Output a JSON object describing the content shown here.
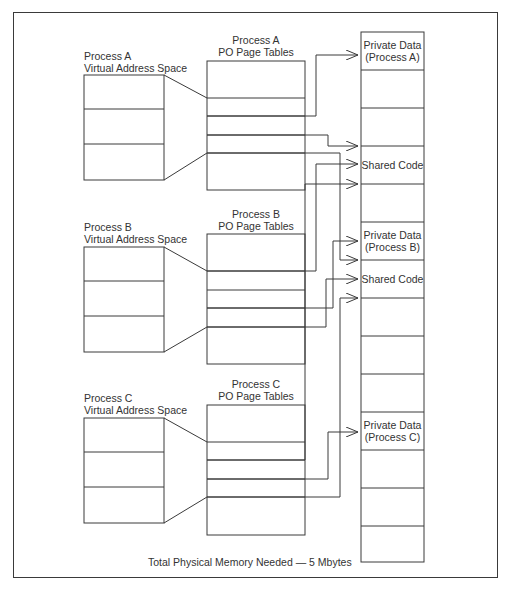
{
  "diagram": {
    "caption": "Total Physical Memory Needed — 5 Mbytes",
    "colors": {
      "line": "#3a3a3a",
      "text": "#333333",
      "background": "#ffffff"
    },
    "processes": [
      {
        "id": "A",
        "va_label_line1": "Process A",
        "va_label_line2": "Virtual Address Space",
        "pt_label_line1": "Process A",
        "pt_label_line2": "PO Page Tables"
      },
      {
        "id": "B",
        "va_label_line1": "Process B",
        "va_label_line2": "Virtual Address Space",
        "pt_label_line1": "Process B",
        "pt_label_line2": "PO Page Tables"
      },
      {
        "id": "C",
        "va_label_line1": "Process C",
        "va_label_line2": "Virtual Address Space",
        "pt_label_line1": "Process C",
        "pt_label_line2": "PO Page Tables"
      }
    ],
    "physical_memory": {
      "frames": [
        {
          "index": 0,
          "line1": "Private Data",
          "line2": "(Process A)"
        },
        {
          "index": 1,
          "line1": "",
          "line2": ""
        },
        {
          "index": 2,
          "line1": "",
          "line2": ""
        },
        {
          "index": 3,
          "line1": "Shared Code",
          "line2": ""
        },
        {
          "index": 4,
          "line1": "",
          "line2": ""
        },
        {
          "index": 5,
          "line1": "Private Data",
          "line2": "(Process B)"
        },
        {
          "index": 6,
          "line1": "Shared Code",
          "line2": ""
        },
        {
          "index": 7,
          "line1": "",
          "line2": ""
        },
        {
          "index": 8,
          "line1": "",
          "line2": ""
        },
        {
          "index": 9,
          "line1": "",
          "line2": ""
        },
        {
          "index": 10,
          "line1": "Private Data",
          "line2": "(Process C)"
        },
        {
          "index": 11,
          "line1": "",
          "line2": ""
        },
        {
          "index": 12,
          "line1": "",
          "line2": ""
        },
        {
          "index": 13,
          "line1": "",
          "line2": ""
        }
      ]
    }
  }
}
